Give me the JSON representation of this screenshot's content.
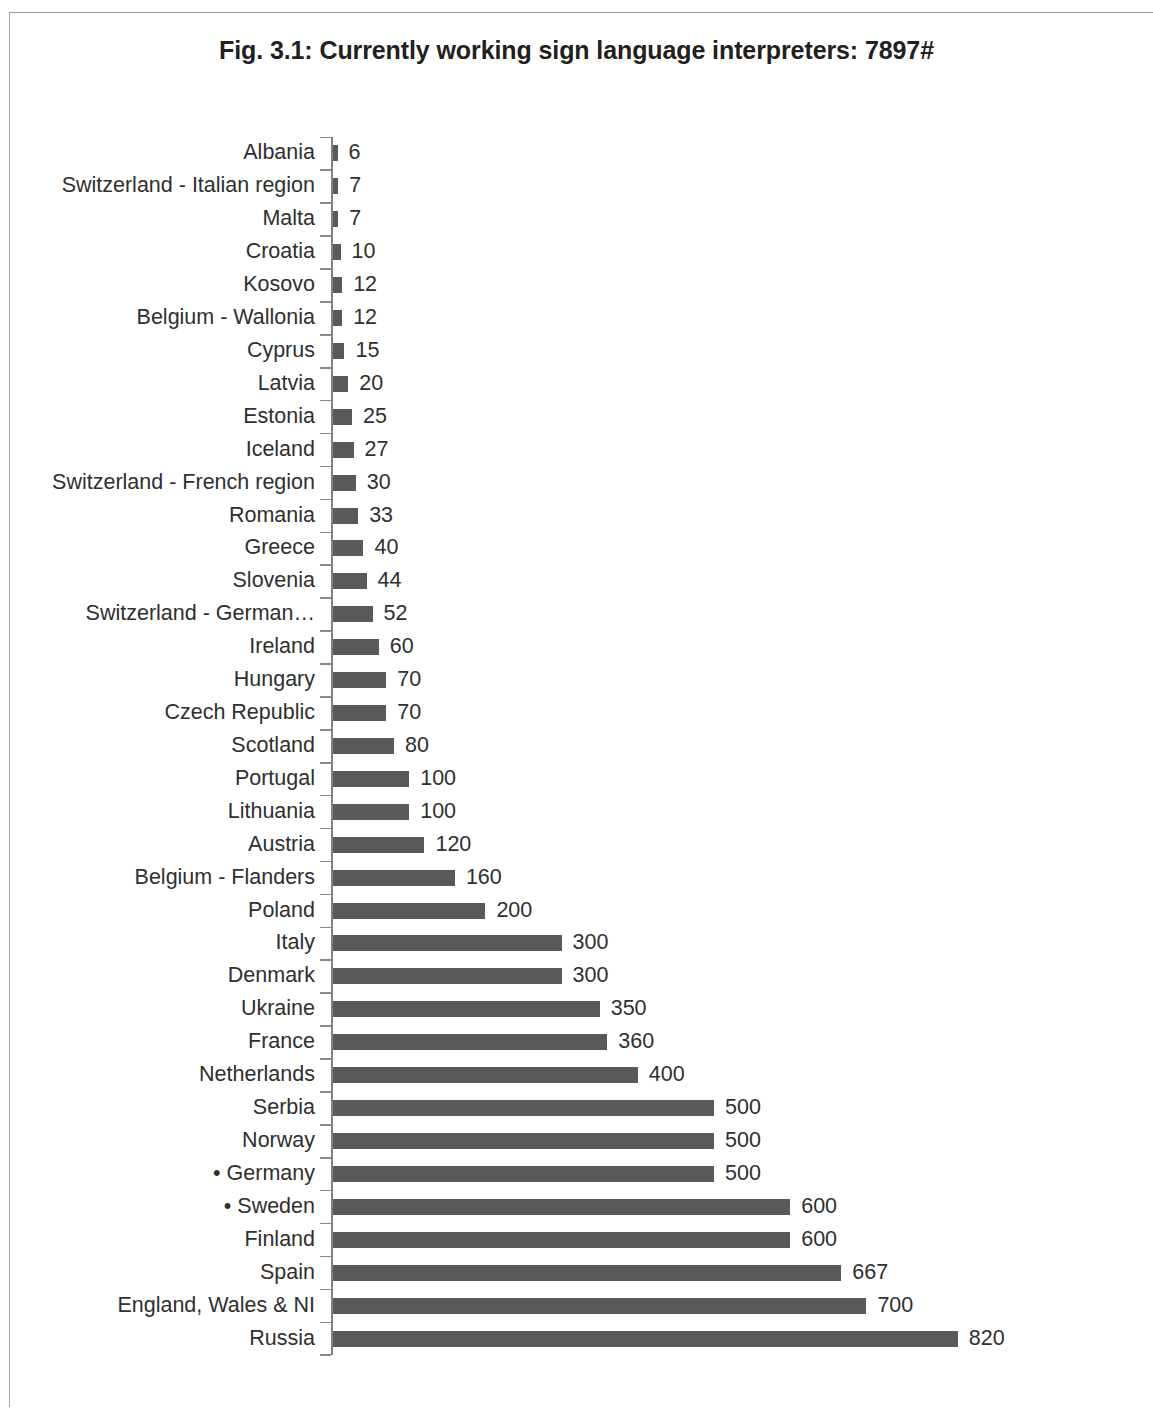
{
  "figure": {
    "title": "Fig. 3.1: Currently working sign language interpreters: 7897#"
  },
  "chart_data": {
    "type": "bar",
    "orientation": "horizontal",
    "title": "Fig. 3.1: Currently working sign language interpreters: 7897#",
    "xlabel": "",
    "ylabel": "",
    "xlim": [
      0,
      820
    ],
    "grid": false,
    "legend": false,
    "total_annotation": "7897#",
    "bar_color": "#595959",
    "data_labels_shown": true,
    "categories": [
      "Albania",
      "Switzerland - Italian region",
      "Malta",
      "Croatia",
      "Kosovo",
      "Belgium - Wallonia",
      "Cyprus",
      "Latvia",
      "Estonia",
      "Iceland",
      "Switzerland - French region",
      "Romania",
      "Greece",
      "Slovenia",
      "Switzerland - German…",
      "Ireland",
      "Hungary",
      "Czech Republic",
      "Scotland",
      "Portugal",
      "Lithuania",
      "Austria",
      "Belgium - Flanders",
      "Poland",
      "Italy",
      "Denmark",
      "Ukraine",
      "France",
      "Netherlands",
      "Serbia",
      "Norway",
      "• Germany",
      "• Sweden",
      "Finland",
      "Spain",
      "England, Wales & NI",
      "Russia"
    ],
    "values": [
      6,
      7,
      7,
      10,
      12,
      12,
      15,
      20,
      25,
      27,
      30,
      33,
      40,
      44,
      52,
      60,
      70,
      70,
      80,
      100,
      100,
      120,
      160,
      200,
      300,
      300,
      350,
      360,
      400,
      500,
      500,
      500,
      600,
      600,
      667,
      700,
      820
    ],
    "value_labels": [
      "6",
      "7",
      "7",
      "10",
      "12",
      "12",
      "15",
      "20",
      "25",
      "27",
      "30",
      "33",
      "40",
      "44",
      "52",
      "60",
      "70",
      "70",
      "80",
      "100",
      "100",
      "120",
      "160",
      "200",
      "300",
      "300",
      "350",
      "360",
      "400",
      "500",
      "500",
      "500",
      "600",
      "600",
      "667",
      "700",
      "820"
    ]
  }
}
